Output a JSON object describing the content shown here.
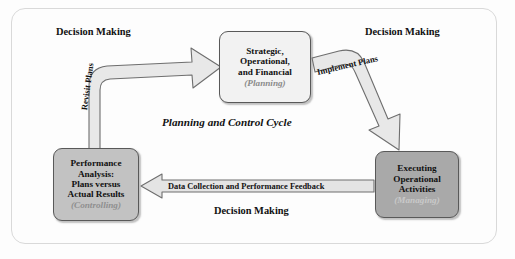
{
  "diagram": {
    "title": "Planning and Control Cycle",
    "frame_border_color": "#d9d9d9",
    "background_color": "#fdfdfd",
    "nodes": [
      {
        "id": "planning",
        "lines": [
          "Strategic,",
          "Operational,",
          "and Financial"
        ],
        "sub": "(Planning)",
        "fill": "#f2f2f2",
        "text_color": "#111111",
        "sub_color": "#8a8a8a"
      },
      {
        "id": "executing",
        "lines": [
          "Executing",
          "Operational",
          "Activities"
        ],
        "sub": "(Managing)",
        "fill": "#a9a9a9",
        "text_color": "#111111",
        "sub_color": "#c9c9c9"
      },
      {
        "id": "performance",
        "lines": [
          "Performance",
          "Analysis:",
          "Plans versus",
          "Actual Results"
        ],
        "sub": "(Controlling)",
        "fill": "#c2c2c2",
        "text_color": "#111111",
        "sub_color": "#8f8f8f"
      }
    ],
    "arrows": [
      {
        "id": "revisit-plans",
        "label": "Revisit Plans",
        "from": "performance",
        "to": "planning",
        "fill": "#e8e8e8",
        "stroke": "#6e6e6e"
      },
      {
        "id": "implement-plans",
        "label": "Implement Plans",
        "from": "planning",
        "to": "executing",
        "fill": "#e8e8e8",
        "stroke": "#6e6e6e"
      },
      {
        "id": "feedback",
        "label": "Data Collection and Performance Feedback",
        "from": "executing",
        "to": "performance",
        "fill": "#e4e4e4",
        "stroke": "#6e6e6e"
      }
    ],
    "annotations": [
      {
        "id": "top-left",
        "text": "Decision Making"
      },
      {
        "id": "top-right",
        "text": "Decision Making"
      },
      {
        "id": "bottom",
        "text": "Decision Making"
      }
    ]
  }
}
